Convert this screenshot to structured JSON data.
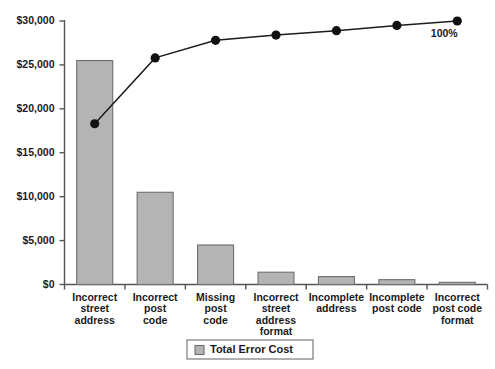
{
  "chart_data": {
    "type": "bar",
    "title": "",
    "xlabel": "",
    "ylabel": "",
    "ylim": [
      0,
      30000
    ],
    "grid": false,
    "legend_position": "bottom",
    "categories": [
      "Incorrect street address",
      "Incorrect post code",
      "Missing post code",
      "Incorrect street address format",
      "Incomplete address",
      "Incomplete post code",
      "Incorrect post code format"
    ],
    "category_lines": [
      [
        "Incorrect",
        "street",
        "address"
      ],
      [
        "Incorrect",
        "post",
        "code"
      ],
      [
        "Missing",
        "post",
        "code"
      ],
      [
        "Incorrect",
        "street",
        "address",
        "format"
      ],
      [
        "Incomplete",
        "address"
      ],
      [
        "Incomplete",
        "post code"
      ],
      [
        "Incorrect",
        "post code",
        "format"
      ]
    ],
    "series": [
      {
        "name": "Total Error Cost",
        "type": "bar",
        "values": [
          25500,
          10500,
          4500,
          1400,
          900,
          550,
          250
        ]
      },
      {
        "name": "Cumulative",
        "type": "line",
        "values": [
          18300,
          25800,
          27800,
          28400,
          28900,
          29500,
          30000
        ]
      }
    ],
    "ytick_labels": [
      "$0",
      "$5,000",
      "$10,000",
      "$15,000",
      "$20,000",
      "$25,000",
      "$30,000"
    ],
    "ytick_values": [
      0,
      5000,
      10000,
      15000,
      20000,
      25000,
      30000
    ],
    "annotations": [
      {
        "text": "100%",
        "at_category_index": 6
      }
    ],
    "legend": [
      {
        "label": "Total Error Cost",
        "color": "#b4b4b4"
      }
    ],
    "colors": {
      "bar_fill": "#b4b4b4",
      "bar_stroke": "#6e6e6e",
      "line": "#1c1c1c",
      "marker": "#111111",
      "axis": "#555555",
      "text": "#1a1a1a",
      "background": "#ffffff"
    }
  }
}
